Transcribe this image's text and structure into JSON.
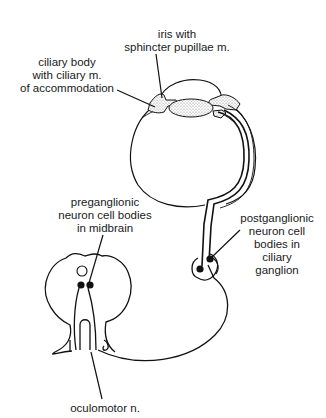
{
  "diagram": {
    "labels": {
      "iris": [
        "iris with",
        "sphincter pupillae m."
      ],
      "ciliary_body": [
        "ciliary body",
        "with ciliary m.",
        "of accommodation"
      ],
      "preganglionic": [
        "preganglionic",
        "neuron cell bodies",
        "in midbrain"
      ],
      "postganglionic": [
        "postganglionic",
        "neuron cell",
        "bodies in",
        "ciliary",
        "ganglion"
      ],
      "oculomotor": [
        "oculomotor n."
      ]
    },
    "colors": {
      "line": "#111111",
      "stipple": "#bdbdbd",
      "background": "#ffffff",
      "text": "#1a1a1a"
    }
  }
}
